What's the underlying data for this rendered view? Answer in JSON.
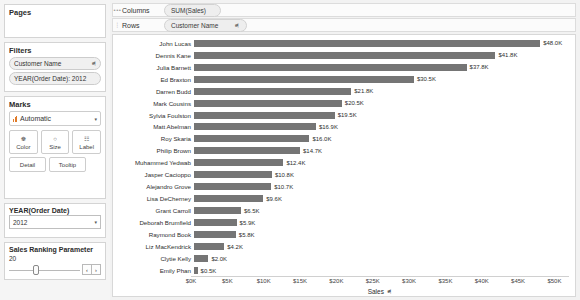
{
  "left_panel": {
    "pages": {
      "title": "Pages"
    },
    "filters": {
      "title": "Filters",
      "items": [
        {
          "label": "Customer Name",
          "icon": "filter-icon"
        },
        {
          "label": "YEAR(Order Date): 2012",
          "icon": ""
        }
      ]
    },
    "marks": {
      "title": "Marks",
      "mark_type": "Automatic",
      "caret": "▾",
      "buttons": [
        {
          "label": "Color",
          "icon": "color-palette-icon",
          "glyph": "☸"
        },
        {
          "label": "Size",
          "icon": "size-circle-icon",
          "glyph": "○"
        },
        {
          "label": "Label",
          "icon": "label-tag-icon",
          "glyph": "☷"
        }
      ],
      "buttons_row2": [
        {
          "label": "Detail",
          "icon": "detail-icon"
        },
        {
          "label": "Tooltip",
          "icon": "tooltip-icon"
        }
      ]
    },
    "year_filter": {
      "title": "YEAR(Order Date)",
      "value": "2012",
      "caret": "▾"
    },
    "parameter": {
      "title": "Sales Ranking Parameter",
      "value": "20",
      "prev_label": "‹",
      "next_label": "›"
    }
  },
  "shelves": {
    "columns": {
      "label": "Columns",
      "handle": "•••",
      "pill": "SUM(Sales)",
      "pill_icon": ""
    },
    "rows": {
      "label": "Rows",
      "handle": "⋮",
      "pill": "Customer Name",
      "pill_icon": "⚑"
    }
  },
  "chart_data": {
    "type": "bar",
    "orientation": "horizontal",
    "title": "",
    "xlabel": "Sales",
    "ylabel": "Customer Name",
    "xlim": [
      0,
      52000
    ],
    "grid": false,
    "legend": "none",
    "bar_color": "#757575",
    "tick_labels": [
      "$0K",
      "$5K",
      "$10K",
      "$15K",
      "$20K",
      "$25K",
      "$30K",
      "$35K",
      "$40K",
      "$45K",
      "$50K"
    ],
    "tick_values": [
      0,
      5000,
      10000,
      15000,
      20000,
      25000,
      30000,
      35000,
      40000,
      45000,
      50000
    ],
    "categories": [
      "John Lucas",
      "Dennis Kane",
      "Julia Barnett",
      "Ed Braxton",
      "Darren Budd",
      "Mark Cousins",
      "Sylvia Foulston",
      "Matt Abelman",
      "Roy Skaria",
      "Philip Brown",
      "Muhammed Yedwab",
      "Jasper Cacioppo",
      "Alejandro Grove",
      "Lisa DeCherney",
      "Grant Carroll",
      "Deborah Brumfield",
      "Raymond Book",
      "Liz MacKendrick",
      "Clytie Kelly",
      "Emily Phan"
    ],
    "values": [
      48000,
      41800,
      37800,
      30500,
      21800,
      20500,
      19500,
      16900,
      16000,
      14700,
      12400,
      10800,
      10700,
      9600,
      6500,
      5900,
      5800,
      4200,
      2000,
      500
    ],
    "value_labels": [
      "$48.0K",
      "$41.8K",
      "$37.8K",
      "$30.5K",
      "$21.8K",
      "$20.5K",
      "$19.5K",
      "$16.9K",
      "$16.0K",
      "$14.7K",
      "$12.4K",
      "$10.8K",
      "$10.7K",
      "$9.6K",
      "$6.5K",
      "$5.9K",
      "$5.8K",
      "$4.2K",
      "$2.0K",
      "$0.5K"
    ]
  }
}
